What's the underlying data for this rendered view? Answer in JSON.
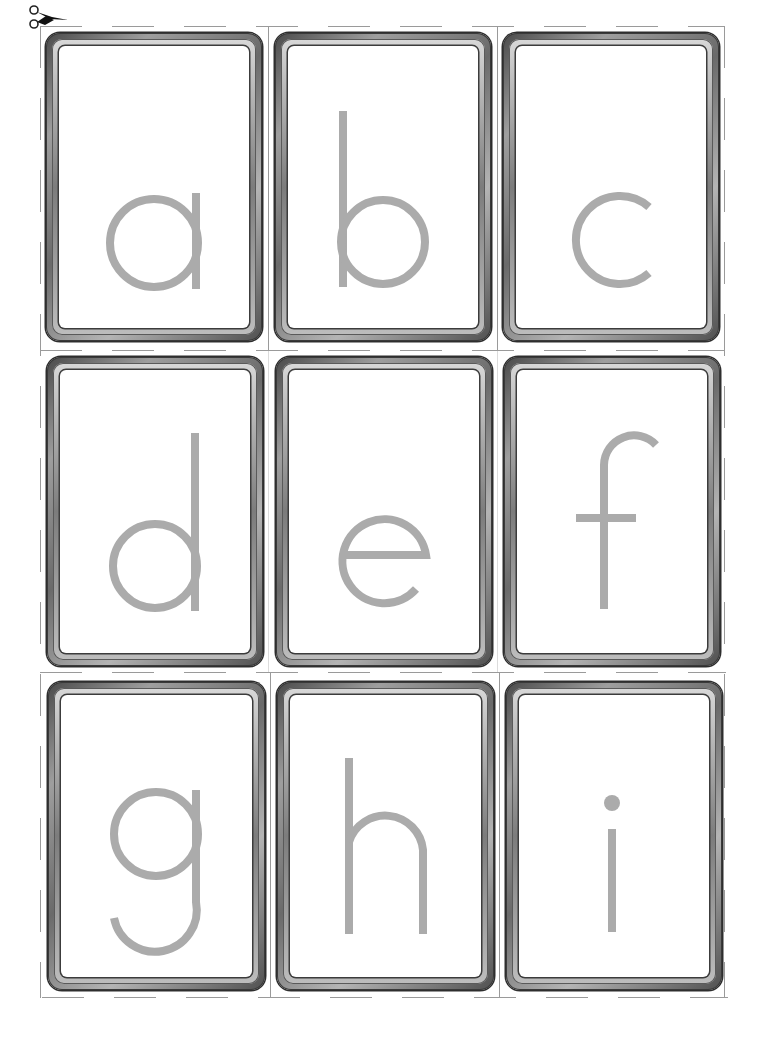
{
  "sheet": {
    "title": "Lowercase alphabet flash cards a–i",
    "letter_color": "#ababab",
    "frame_color": "#6e6e6e",
    "cut_line_color": "#9a9a9a"
  },
  "scissors_icon": "scissors-icon",
  "cards": [
    {
      "letter": "a",
      "row": 1,
      "col": 1
    },
    {
      "letter": "b",
      "row": 1,
      "col": 2
    },
    {
      "letter": "c",
      "row": 1,
      "col": 3
    },
    {
      "letter": "d",
      "row": 2,
      "col": 1
    },
    {
      "letter": "e",
      "row": 2,
      "col": 2
    },
    {
      "letter": "f",
      "row": 2,
      "col": 3
    },
    {
      "letter": "g",
      "row": 3,
      "col": 1
    },
    {
      "letter": "h",
      "row": 3,
      "col": 2
    },
    {
      "letter": "i",
      "row": 3,
      "col": 3
    }
  ]
}
